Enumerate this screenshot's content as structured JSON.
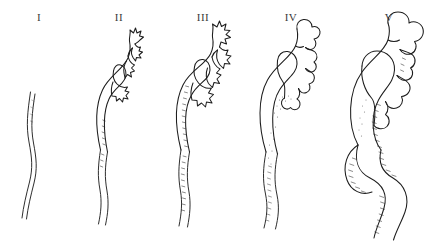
{
  "figure": {
    "background_color": "#ffffff",
    "ink_color": "#1d1d1d",
    "width": 442,
    "height": 243,
    "panel_count": 5
  },
  "panels": [
    {
      "label": "I",
      "name": "grade-1",
      "description": "Normal slender ureter, no pelvic or calyceal dilatation",
      "calyx_shape": "none",
      "ureter": "slender, gently undulating",
      "shading": "none"
    },
    {
      "label": "II",
      "name": "grade-2",
      "description": "Sharp, pointed star-shaped calyces with slender renal pelvis",
      "calyx_shape": "sharp-spiky",
      "calyx_count": 3,
      "ureter": "slender, gently undulating",
      "shading": "light hatching along pelvis"
    },
    {
      "label": "III",
      "name": "grade-3",
      "description": "Enlarged spiky calyces, early pelvic dilatation with wall hatching",
      "calyx_shape": "sharp-spiky-enlarged",
      "calyx_count": 4,
      "ureter": "mildly widened, undulating",
      "shading": "dense hatching along inner pelvis and ureter"
    },
    {
      "label": "IV",
      "name": "grade-4",
      "description": "Rounded clubbed calyces with dilated renal pelvis and ureter",
      "calyx_shape": "rounded-clubbed",
      "calyx_count": 5,
      "ureter": "dilated, undulating",
      "shading": "stippling with scattered hatching"
    },
    {
      "label": "V",
      "name": "grade-5",
      "description": "Gross ballooned calyces, massively dilated pelvis and tortuous ureter",
      "calyx_shape": "ballooned",
      "calyx_count": 5,
      "ureter": "grossly dilated and tortuous",
      "shading": "heavy hatching along the inner curves"
    }
  ]
}
